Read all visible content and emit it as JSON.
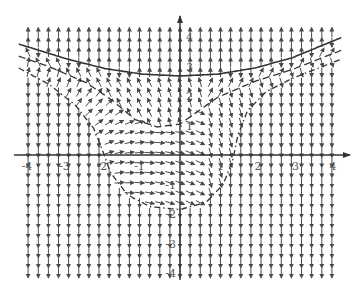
{
  "chart_data": {
    "type": "vector-field",
    "title": "",
    "xlabel": "",
    "ylabel": "",
    "xlim": [
      -4.3,
      4.3
    ],
    "ylim": [
      -4.2,
      4.6
    ],
    "grid": false,
    "x_ticks": [
      {
        "value": -4,
        "label": "-4"
      },
      {
        "value": -3,
        "label": "-3"
      },
      {
        "value": -2,
        "label": "-2"
      },
      {
        "value": -1,
        "label": "-1"
      },
      {
        "value": 1,
        "label": "1"
      },
      {
        "value": 2,
        "label": "2"
      },
      {
        "value": 3,
        "label": "3"
      },
      {
        "value": 4,
        "label": "4"
      }
    ],
    "y_ticks": [
      {
        "value": 4,
        "label": "4"
      },
      {
        "value": 3,
        "label": "3"
      },
      {
        "value": 2,
        "label": "2"
      },
      {
        "value": 1,
        "label": "1"
      },
      {
        "value": -1,
        "label": "-1"
      },
      {
        "value": -2,
        "label": "-2"
      },
      {
        "value": -3,
        "label": "-3"
      },
      {
        "value": -4,
        "label": "-4"
      }
    ],
    "field": {
      "x_spacing": 0.27,
      "y_spacing": 0.34,
      "x_start": -4.05,
      "y_start": -4.0,
      "y_end": 4.2,
      "arrow_length": 0.28,
      "outside_region": "vertical arrows: upward above solid curve, downward below",
      "inside_region": "swirling flow bounded by dash-dot curve"
    },
    "curves": [
      {
        "name": "solid-curve",
        "style": "solid",
        "points": [
          [
            -4.3,
            3.76
          ],
          [
            -3,
            3.25
          ],
          [
            -2,
            2.93
          ],
          [
            -1,
            2.74
          ],
          [
            0,
            2.68
          ],
          [
            1,
            2.74
          ],
          [
            2,
            2.95
          ],
          [
            3,
            3.3
          ],
          [
            4.3,
            3.98
          ]
        ]
      },
      {
        "name": "dashed-curve",
        "style": "dashed",
        "points": [
          [
            -4.3,
            3.35
          ],
          [
            -3.5,
            3.0
          ],
          [
            -2.5,
            2.45
          ],
          [
            -1.8,
            1.85
          ],
          [
            -1.2,
            1.2
          ],
          [
            -0.6,
            0.95
          ],
          [
            0,
            1.05
          ],
          [
            0.5,
            1.5
          ],
          [
            1,
            1.95
          ],
          [
            2,
            2.5
          ],
          [
            3,
            2.9
          ],
          [
            4.3,
            3.55
          ]
        ]
      },
      {
        "name": "dash-dot-curve",
        "style": "dashdot",
        "points": [
          [
            -4.3,
            2.95
          ],
          [
            -3.5,
            2.4
          ],
          [
            -2.8,
            1.7
          ],
          [
            -2.3,
            0.9
          ],
          [
            -2.05,
            0.1
          ],
          [
            -1.85,
            -0.6
          ],
          [
            -1.4,
            -1.35
          ],
          [
            -0.8,
            -1.75
          ],
          [
            0,
            -1.85
          ],
          [
            0.7,
            -1.6
          ],
          [
            1.15,
            -1.0
          ],
          [
            1.4,
            -0.2
          ],
          [
            1.55,
            0.7
          ],
          [
            1.8,
            1.5
          ],
          [
            2.3,
            2.15
          ],
          [
            3,
            2.6
          ],
          [
            4.3,
            3.25
          ]
        ]
      }
    ],
    "colors": {
      "axis": "#333333",
      "arrow": "#4a4a4a",
      "curve": "#333333",
      "label": "#555555"
    }
  }
}
